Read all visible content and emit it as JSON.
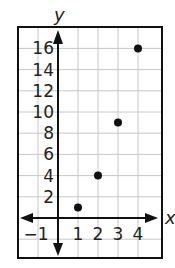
{
  "chart_data": {
    "type": "scatter",
    "title": "",
    "xlabel": "x",
    "ylabel": "y",
    "x": [
      1,
      2,
      3,
      4
    ],
    "y": [
      1,
      4,
      9,
      16
    ],
    "series": [
      {
        "name": "points",
        "points": [
          [
            1,
            1
          ],
          [
            2,
            4
          ],
          [
            3,
            9
          ],
          [
            4,
            16
          ]
        ]
      }
    ],
    "xlim": [
      -2,
      5
    ],
    "ylim": [
      -4,
      18
    ],
    "x_ticks": [
      -1,
      1,
      2,
      3,
      4
    ],
    "x_tick_labels": [
      "−1",
      "1",
      "2",
      "3",
      "4"
    ],
    "y_ticks": [
      2,
      4,
      6,
      8,
      10,
      12,
      14,
      16
    ],
    "y_tick_labels": [
      "2",
      "4",
      "6",
      "8",
      "10",
      "12",
      "14",
      "16"
    ],
    "grid": true,
    "legend": "none",
    "colors": {
      "point": "#111111",
      "grid": "#c8c8c8",
      "axis": "#111111",
      "frame": "#111111"
    }
  }
}
